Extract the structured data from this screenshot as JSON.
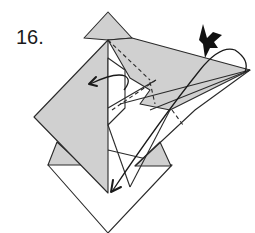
{
  "diagram": {
    "step_number": "16.",
    "colors": {
      "paper_colored": "#d0d0d0",
      "paper_white": "#ffffff",
      "line": "#2a2a2a"
    },
    "symbols": [
      "valley-fold-arrow-left",
      "valley-fold-arrow-down",
      "swivel-arc-arrow",
      "sink-push-arrow"
    ]
  }
}
